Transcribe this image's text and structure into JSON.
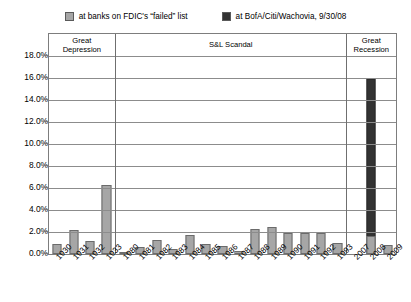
{
  "legend": {
    "items": [
      {
        "label": "at banks on FDIC's “failed” list",
        "color": "#a6a6a6",
        "icon": "legend-swatch-icon"
      },
      {
        "label": "at BofA/Citi/Wachovia, 9/30/08",
        "color": "#333333",
        "icon": "legend-swatch-icon"
      }
    ]
  },
  "bands": [
    {
      "id": "great-depression",
      "label_lines": [
        "Great",
        "Depression"
      ]
    },
    {
      "id": "sl-scandal",
      "label_lines": [
        "S&L Scandal"
      ]
    },
    {
      "id": "great-recession",
      "label_lines": [
        "Great",
        "Recession"
      ]
    }
  ],
  "axis": {
    "y_ticks": [
      "18.0%",
      "16.0%",
      "14.0%",
      "12.0%",
      "10.0%",
      "8.0%",
      "6.0%",
      "4.0%",
      "2.0%",
      "0.0%"
    ]
  },
  "chart_data": {
    "type": "bar",
    "title": "",
    "subtitle": "",
    "xlabel": "",
    "ylabel": "",
    "ylim": [
      0,
      18
    ],
    "ytick_values": [
      0,
      2,
      4,
      6,
      8,
      10,
      12,
      14,
      16,
      18
    ],
    "ytick_labels": [
      "0.0%",
      "2.0%",
      "4.0%",
      "6.0%",
      "8.0%",
      "10.0%",
      "12.0%",
      "14.0%",
      "16.0%",
      "18.0%"
    ],
    "grid": true,
    "legend_position": "top-center",
    "stacked": true,
    "units": "percent",
    "categories": [
      "1930",
      "1931",
      "1932",
      "1933",
      "1980",
      "1981",
      "1982",
      "1983",
      "1984",
      "1985",
      "1986",
      "1987",
      "1988",
      "1989",
      "1990",
      "1991",
      "1992",
      "1993",
      "2007",
      "2008",
      "2009"
    ],
    "series": [
      {
        "name": "at banks on FDIC's “failed” list",
        "color": "#a6a6a6",
        "values": [
          0.9,
          2.2,
          1.2,
          6.3,
          0.2,
          0.6,
          1.3,
          0.5,
          1.7,
          0.9,
          0.7,
          0.3,
          2.3,
          2.5,
          1.9,
          1.9,
          1.9,
          1.0,
          0.0,
          1.6,
          0.8
        ]
      },
      {
        "name": "at BofA/Citi/Wachovia, 9/30/08",
        "color": "#333333",
        "values": [
          0,
          0,
          0,
          0,
          0,
          0,
          0,
          0,
          0,
          0,
          0,
          0,
          0,
          0,
          0,
          0,
          0,
          0,
          0,
          14.3,
          0
        ]
      }
    ],
    "annotations": [
      {
        "text": "Great Depression",
        "span": [
          "1930",
          "1933"
        ]
      },
      {
        "text": "S&L Scandal",
        "span": [
          "1980",
          "1993"
        ]
      },
      {
        "text": "Great Recession",
        "span": [
          "2007",
          "2009"
        ]
      }
    ]
  }
}
